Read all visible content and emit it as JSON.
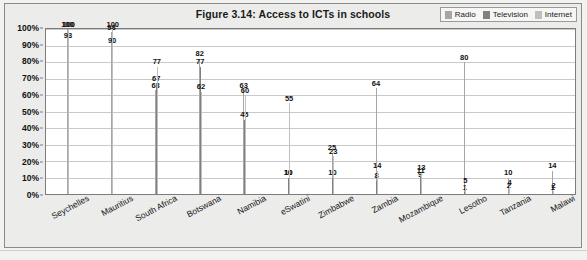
{
  "figure": {
    "title": "Figure 3.14: Access to ICTs in schools"
  },
  "legend": {
    "position": "top-right",
    "entries": [
      {
        "label": "Radio",
        "color": "#a6a6a6"
      },
      {
        "label": "Television",
        "color": "#808080"
      },
      {
        "label": "Internet",
        "color": "#bfbfbf"
      }
    ]
  },
  "chart_data": {
    "type": "bar",
    "title": "Figure 3.14: Access to ICTs in schools",
    "xlabel": "",
    "ylabel": "",
    "ylim": [
      0,
      100
    ],
    "ytick_labels": [
      "0%",
      "10%",
      "20%",
      "30%",
      "40%",
      "50%",
      "60%",
      "70%",
      "80%",
      "90%",
      "100%"
    ],
    "ytick_values": [
      0,
      10,
      20,
      30,
      40,
      50,
      60,
      70,
      80,
      90,
      100
    ],
    "grid": true,
    "legend_position": "top-right",
    "categories": [
      "Seychelles",
      "Mauritius",
      "South Africa",
      "Botswana",
      "Namibia",
      "eSwatini",
      "Zimbabwe",
      "Zambia",
      "Mozambique",
      "Lesotho",
      "Tanzania",
      "Malawi"
    ],
    "series": [
      {
        "name": "Radio",
        "color": "#a6a6a6",
        "values": [
          100,
          98,
          63,
          82,
          63,
          10,
          25,
          64,
          9,
          80,
          10,
          14
        ]
      },
      {
        "name": "Television",
        "color": "#808080",
        "values": [
          93,
          90,
          67,
          77,
          45,
          10,
          10,
          8,
          11,
          1,
          2,
          1
        ]
      },
      {
        "name": "Internet",
        "color": "#bfbfbf",
        "values": [
          100,
          100,
          77,
          62,
          60,
          55,
          23,
          14,
          13,
          5,
          4,
          2
        ]
      }
    ]
  },
  "footnote": {
    "text": ""
  }
}
